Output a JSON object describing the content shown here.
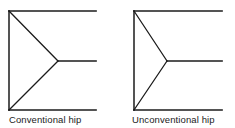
{
  "figure": {
    "background_color": "#ffffff",
    "line_color": "#1b1b1b",
    "stroke_width": 1.6,
    "diagrams": [
      {
        "id": "conventional",
        "caption": "Conventional hip",
        "description": "Roof plan with hip rafters meeting ridge near the left of the span",
        "geometry": {
          "left_edge_x": 9,
          "top_eave_y": 11,
          "bottom_eave_y": 110,
          "right_edge_x": 96,
          "apex_x": 58,
          "apex_y": 61,
          "top_eave": [
            9,
            11,
            96,
            11
          ],
          "bottom_eave": [
            9,
            110,
            96,
            110
          ],
          "left_edge": [
            9,
            11,
            9,
            110
          ],
          "hip_upper": [
            9,
            11,
            58,
            61
          ],
          "hip_lower": [
            9,
            110,
            58,
            61
          ],
          "ridge": [
            58,
            61,
            96,
            61
          ]
        }
      },
      {
        "id": "unconventional",
        "caption": "Unconventional hip",
        "description": "Roof plan with hip rafters meeting ridge at a shallower angle",
        "geometry": {
          "left_edge_x": 134,
          "top_eave_y": 11,
          "bottom_eave_y": 110,
          "right_edge_x": 222,
          "apex_x": 167,
          "apex_y": 61,
          "top_eave": [
            134,
            11,
            222,
            11
          ],
          "bottom_eave": [
            134,
            110,
            222,
            110
          ],
          "left_edge": [
            134,
            11,
            134,
            110
          ],
          "hip_upper": [
            134,
            11,
            167,
            61
          ],
          "hip_lower": [
            134,
            110,
            167,
            61
          ],
          "ridge": [
            167,
            61,
            222,
            61
          ]
        }
      }
    ]
  }
}
